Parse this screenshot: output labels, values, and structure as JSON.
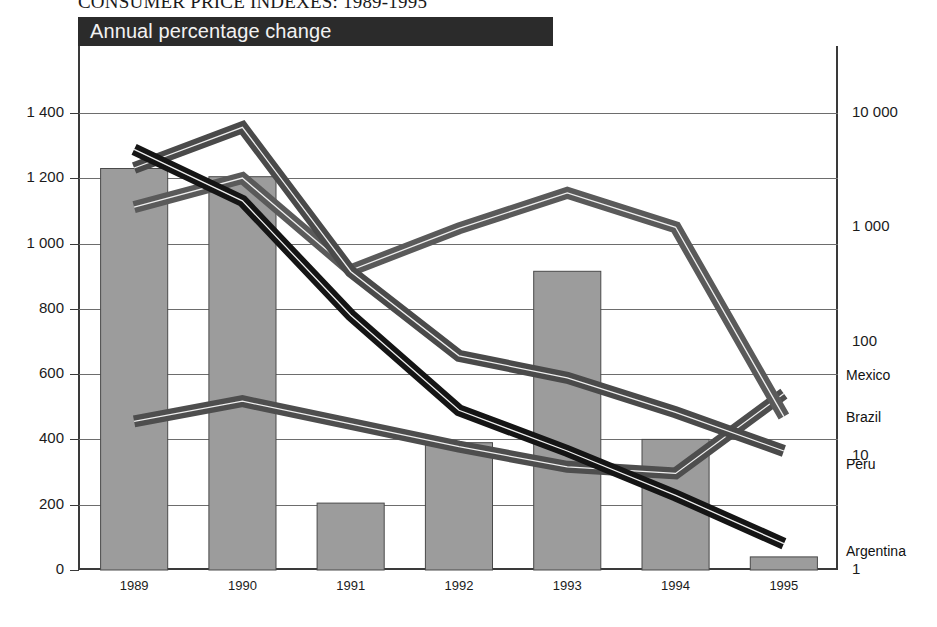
{
  "figure": {
    "title": "CONSUMER PRICE INDEXES: 1989-1995",
    "banner": "Annual percentage change"
  },
  "legend": {
    "region_label": "Region",
    "right_note": "countries (right axis)",
    "region_swatch_color": "#9c9c9c"
  },
  "axes": {
    "left_ticks": [
      "1 400",
      "1 200",
      "1 000",
      "800",
      "600",
      "400",
      "200",
      "0"
    ],
    "right_ticks": [
      "10 000",
      "1 000",
      "100",
      "10",
      "1"
    ],
    "x_ticks": [
      "1989",
      "1990",
      "1991",
      "1992",
      "1993",
      "1994",
      "1995"
    ]
  },
  "series_labels": {
    "mexico": "Mexico",
    "brazil": "Brazil",
    "peru": "Peru",
    "argentina": "Argentina"
  },
  "chart_data": {
    "type": "bar",
    "title": "CONSUMER PRICE INDEXES: 1989-1995",
    "subtitle": "Annual percentage change",
    "xlabel": "",
    "ylabel": "",
    "categories": [
      "1989",
      "1990",
      "1991",
      "1992",
      "1993",
      "1994",
      "1995"
    ],
    "grid": true,
    "legend_position": "top-left",
    "left_axis": {
      "name": "Region",
      "scale": "linear",
      "ylim": [
        0,
        1400
      ],
      "ticks": [
        0,
        200,
        400,
        600,
        800,
        1000,
        1200,
        1400
      ],
      "tick_labels": [
        "0",
        "200",
        "400",
        "600",
        "800",
        "1 000",
        "1 200",
        "1 400"
      ]
    },
    "right_axis": {
      "name": "countries (right axis)",
      "scale": "log",
      "ylim": [
        1,
        10000
      ],
      "ticks": [
        1,
        10,
        100,
        1000,
        10000
      ],
      "tick_labels": [
        "1",
        "10",
        "100",
        "1 000",
        "10 000"
      ]
    },
    "bars": {
      "name": "Region",
      "axis": "left",
      "color": "#9c9c9c",
      "values": [
        1230,
        1205,
        205,
        390,
        915,
        400,
        40
      ]
    },
    "series": [
      {
        "name": "Mexico",
        "axis": "right",
        "color": "#4e4e4e",
        "style": "ribbon-gray",
        "values": [
          20,
          30,
          19,
          12,
          8,
          7,
          35
        ]
      },
      {
        "name": "Brazil",
        "axis": "right",
        "color": "#5a5a5a",
        "style": "ribbon-gray",
        "values": [
          1500,
          2700,
          420,
          980,
          2000,
          1000,
          22
        ]
      },
      {
        "name": "Peru",
        "axis": "right",
        "color": "#4a4a4a",
        "style": "ribbon-gray",
        "values": [
          3300,
          7500,
          410,
          75,
          48,
          24,
          11
        ]
      },
      {
        "name": "Argentina",
        "axis": "right",
        "color": "#151515",
        "style": "ribbon-black",
        "values": [
          4800,
          1700,
          170,
          25,
          11,
          4.5,
          1.7
        ]
      }
    ],
    "annotations": [
      {
        "text": "Mexico",
        "at_x": "1995"
      },
      {
        "text": "Brazil",
        "at_x": "1995"
      },
      {
        "text": "Peru",
        "at_x": "1995"
      },
      {
        "text": "Argentina",
        "at_x": "1995"
      }
    ]
  }
}
